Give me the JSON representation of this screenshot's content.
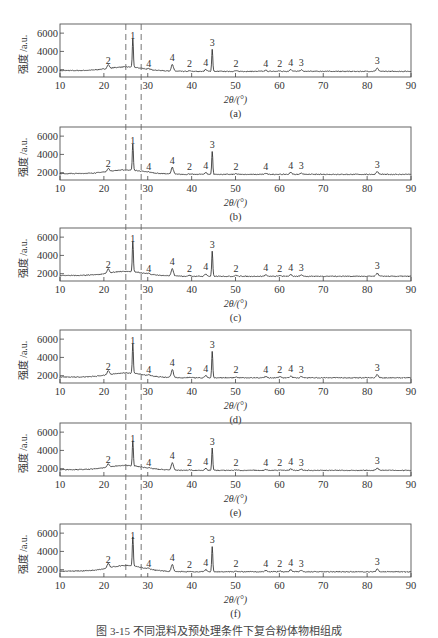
{
  "figure": {
    "caption": "图 3-15  不同混料及预处理条件下复合粉体物相组成",
    "xlabel": "2θ/(°)",
    "ylabel": "强度 /a.u.",
    "dashed_lines_x": [
      25,
      28.5
    ]
  },
  "chart_data": [
    {
      "type": "line",
      "panel": "(a)",
      "title": "(a)",
      "xlabel": "2θ/(°)",
      "ylabel": "强度 /a.u.",
      "xlim": [
        10,
        90
      ],
      "ylim": [
        1200,
        7000
      ],
      "xticks": [
        10,
        20,
        30,
        40,
        50,
        60,
        70,
        80,
        90
      ],
      "yticks": [
        2000,
        4000,
        6000
      ],
      "baseline": 1900,
      "hump": {
        "center": 25,
        "height": 400
      },
      "peaks": [
        {
          "x": 21,
          "y": 2300,
          "label": "2"
        },
        {
          "x": 26.6,
          "y": 5000,
          "label": "1"
        },
        {
          "x": 30.2,
          "y": 1950,
          "label": "4"
        },
        {
          "x": 35.6,
          "y": 2600,
          "label": "4"
        },
        {
          "x": 39.5,
          "y": 1950,
          "label": "2"
        },
        {
          "x": 43.2,
          "y": 2100,
          "label": "4"
        },
        {
          "x": 44.7,
          "y": 4300,
          "label": "3"
        },
        {
          "x": 50.1,
          "y": 1950,
          "label": "2"
        },
        {
          "x": 56.9,
          "y": 2000,
          "label": "4"
        },
        {
          "x": 60.1,
          "y": 1950,
          "label": "2"
        },
        {
          "x": 62.6,
          "y": 2100,
          "label": "4"
        },
        {
          "x": 65.0,
          "y": 2050,
          "label": "3"
        },
        {
          "x": 82.3,
          "y": 2250,
          "label": "3"
        }
      ]
    },
    {
      "type": "line",
      "panel": "(b)",
      "title": "(b)",
      "xlabel": "2θ/(°)",
      "ylabel": "强度 /a.u.",
      "xlim": [
        10,
        90
      ],
      "ylim": [
        1200,
        7000
      ],
      "xticks": [
        10,
        20,
        30,
        40,
        50,
        60,
        70,
        80,
        90
      ],
      "yticks": [
        2000,
        4000,
        6000
      ],
      "baseline": 1900,
      "hump": {
        "center": 25,
        "height": 400
      },
      "peaks": [
        {
          "x": 21,
          "y": 2250,
          "label": "2"
        },
        {
          "x": 26.6,
          "y": 4800,
          "label": "1"
        },
        {
          "x": 30.2,
          "y": 1950,
          "label": "4"
        },
        {
          "x": 35.6,
          "y": 2650,
          "label": "4"
        },
        {
          "x": 39.5,
          "y": 1950,
          "label": "2"
        },
        {
          "x": 43.2,
          "y": 2100,
          "label": "4"
        },
        {
          "x": 44.7,
          "y": 4400,
          "label": "3"
        },
        {
          "x": 50.1,
          "y": 1950,
          "label": "2"
        },
        {
          "x": 56.9,
          "y": 2000,
          "label": "4"
        },
        {
          "x": 62.6,
          "y": 2100,
          "label": "4"
        },
        {
          "x": 65.0,
          "y": 2050,
          "label": "3"
        },
        {
          "x": 82.3,
          "y": 2200,
          "label": "3"
        }
      ]
    },
    {
      "type": "line",
      "panel": "(c)",
      "title": "(c)",
      "xlabel": "2θ/(°)",
      "ylabel": "强度 /a.u.",
      "xlim": [
        10,
        90
      ],
      "ylim": [
        1200,
        7000
      ],
      "xticks": [
        10,
        20,
        30,
        40,
        50,
        60,
        70,
        80,
        90
      ],
      "yticks": [
        2000,
        4000,
        6000
      ],
      "baseline": 1800,
      "hump": {
        "center": 25,
        "height": 450
      },
      "peaks": [
        {
          "x": 21,
          "y": 2250,
          "label": "2"
        },
        {
          "x": 26.6,
          "y": 5100,
          "label": "1"
        },
        {
          "x": 30.2,
          "y": 1900,
          "label": "4"
        },
        {
          "x": 35.6,
          "y": 2600,
          "label": "4"
        },
        {
          "x": 39.5,
          "y": 1900,
          "label": "2"
        },
        {
          "x": 43.2,
          "y": 2050,
          "label": "4"
        },
        {
          "x": 44.7,
          "y": 4500,
          "label": "3"
        },
        {
          "x": 50.1,
          "y": 1900,
          "label": "2"
        },
        {
          "x": 56.9,
          "y": 1950,
          "label": "4"
        },
        {
          "x": 60.1,
          "y": 1900,
          "label": "2"
        },
        {
          "x": 62.6,
          "y": 2000,
          "label": "4"
        },
        {
          "x": 65.0,
          "y": 1950,
          "label": "3"
        },
        {
          "x": 82.3,
          "y": 2150,
          "label": "3"
        }
      ]
    },
    {
      "type": "line",
      "panel": "(d)",
      "title": "(d)",
      "xlabel": "2θ/(°)",
      "ylabel": "强度 /a.u.",
      "xlim": [
        10,
        90
      ],
      "ylim": [
        1200,
        7000
      ],
      "xticks": [
        10,
        20,
        30,
        40,
        50,
        60,
        70,
        80,
        90
      ],
      "yticks": [
        2000,
        4000,
        6000
      ],
      "baseline": 1850,
      "hump": {
        "center": 25,
        "height": 450
      },
      "peaks": [
        {
          "x": 21,
          "y": 2300,
          "label": "2"
        },
        {
          "x": 26.6,
          "y": 5100,
          "label": "1"
        },
        {
          "x": 30.2,
          "y": 1950,
          "label": "4"
        },
        {
          "x": 35.6,
          "y": 2700,
          "label": "4"
        },
        {
          "x": 39.5,
          "y": 1900,
          "label": "2"
        },
        {
          "x": 43.2,
          "y": 2100,
          "label": "4"
        },
        {
          "x": 44.7,
          "y": 4700,
          "label": "3"
        },
        {
          "x": 50.1,
          "y": 1950,
          "label": "2"
        },
        {
          "x": 56.9,
          "y": 2000,
          "label": "4"
        },
        {
          "x": 60.1,
          "y": 1950,
          "label": "2"
        },
        {
          "x": 62.6,
          "y": 2050,
          "label": "4"
        },
        {
          "x": 65.0,
          "y": 2000,
          "label": "3"
        },
        {
          "x": 82.3,
          "y": 2200,
          "label": "3"
        }
      ]
    },
    {
      "type": "line",
      "panel": "(e)",
      "title": "(e)",
      "xlabel": "2θ/(°)",
      "ylabel": "强度 /a.u.",
      "xlim": [
        10,
        90
      ],
      "ylim": [
        1200,
        7000
      ],
      "xticks": [
        10,
        20,
        30,
        40,
        50,
        60,
        70,
        80,
        90
      ],
      "yticks": [
        2000,
        4000,
        6000
      ],
      "baseline": 1900,
      "hump": {
        "center": 25,
        "height": 450
      },
      "peaks": [
        {
          "x": 21,
          "y": 2300,
          "label": "2"
        },
        {
          "x": 26.6,
          "y": 4600,
          "label": "1"
        },
        {
          "x": 30.2,
          "y": 1950,
          "label": "4"
        },
        {
          "x": 35.6,
          "y": 2700,
          "label": "4"
        },
        {
          "x": 39.5,
          "y": 1950,
          "label": "2"
        },
        {
          "x": 43.2,
          "y": 2100,
          "label": "4"
        },
        {
          "x": 44.7,
          "y": 4300,
          "label": "3"
        },
        {
          "x": 50.1,
          "y": 1950,
          "label": "2"
        },
        {
          "x": 56.9,
          "y": 2000,
          "label": "4"
        },
        {
          "x": 60.1,
          "y": 1950,
          "label": "2"
        },
        {
          "x": 62.6,
          "y": 2050,
          "label": "4"
        },
        {
          "x": 65.0,
          "y": 2000,
          "label": "3"
        },
        {
          "x": 82.3,
          "y": 2150,
          "label": "3"
        }
      ]
    },
    {
      "type": "line",
      "panel": "(f)",
      "title": "(f)",
      "xlabel": "2θ/(°)",
      "ylabel": "强度 /a.u.",
      "xlim": [
        10,
        90
      ],
      "ylim": [
        1200,
        7000
      ],
      "xticks": [
        10,
        20,
        30,
        40,
        50,
        60,
        70,
        80,
        90
      ],
      "yticks": [
        2000,
        4000,
        6000
      ],
      "baseline": 1850,
      "hump": {
        "center": 25,
        "height": 600
      },
      "peaks": [
        {
          "x": 21,
          "y": 2350,
          "label": "2"
        },
        {
          "x": 26.6,
          "y": 5000,
          "label": "1"
        },
        {
          "x": 30.2,
          "y": 1950,
          "label": "4"
        },
        {
          "x": 35.6,
          "y": 2600,
          "label": "4"
        },
        {
          "x": 39.5,
          "y": 1900,
          "label": "2"
        },
        {
          "x": 43.2,
          "y": 2100,
          "label": "4"
        },
        {
          "x": 44.7,
          "y": 4600,
          "label": "3"
        },
        {
          "x": 50.1,
          "y": 1950,
          "label": "2"
        },
        {
          "x": 56.9,
          "y": 2000,
          "label": "4"
        },
        {
          "x": 60.1,
          "y": 1950,
          "label": "2"
        },
        {
          "x": 62.6,
          "y": 2100,
          "label": "4"
        },
        {
          "x": 65.0,
          "y": 2000,
          "label": "3"
        },
        {
          "x": 82.3,
          "y": 2150,
          "label": "3"
        }
      ]
    }
  ]
}
